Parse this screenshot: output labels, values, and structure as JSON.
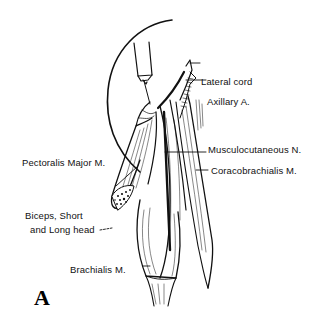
{
  "figure": {
    "panel_letter": "A",
    "labels": {
      "lateral_cord": "Lateral cord",
      "axillary_artery": "Axillary A.",
      "musculocutaneous_nerve": "Musculocutaneous N.",
      "coracobrachialis": "Coracobrachialis M.",
      "pectoralis_major": "Pectoralis Major M.",
      "biceps_line1": "Biceps, Short",
      "biceps_line2": "and Long head",
      "brachialis": "Brachialis M."
    }
  },
  "colors": {
    "ink": "#111111",
    "background": "#ffffff"
  }
}
